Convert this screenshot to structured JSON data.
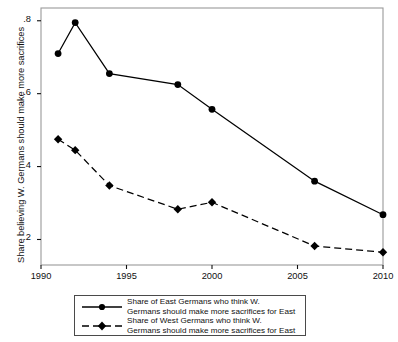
{
  "chart_data": {
    "type": "line",
    "title": "",
    "xlabel": "",
    "ylabel": "Share believing W. Germans should make more sacrifices",
    "xlim": [
      1990,
      2010
    ],
    "ylim": [
      0.13,
      0.835
    ],
    "xticks": [
      1990,
      1995,
      2000,
      2005,
      2010
    ],
    "xtick_labels": [
      "1990",
      "1995",
      "2000",
      "2005",
      "2010"
    ],
    "yticks": [
      0.2,
      0.4,
      0.6,
      0.8
    ],
    "ytick_labels": [
      ".2",
      ".4",
      ".6",
      ".8"
    ],
    "grid": false,
    "legend_position": "below",
    "series": [
      {
        "name": "east",
        "legend_line1": "Share of East Germans who think W.",
        "legend_line2": "Germans should make more sacrifices for East",
        "marker": "circle",
        "linestyle": "solid",
        "color": "#000000",
        "x": [
          1991,
          1992,
          1994,
          1998,
          2000,
          2006,
          2010
        ],
        "values": [
          0.71,
          0.795,
          0.655,
          0.625,
          0.557,
          0.36,
          0.268
        ]
      },
      {
        "name": "west",
        "legend_line1": "Share of West Germans who think W.",
        "legend_line2": "Germans should make more sacrifices for East",
        "marker": "diamond",
        "linestyle": "dashed",
        "color": "#000000",
        "x": [
          1991,
          1992,
          1994,
          1998,
          2000,
          2006,
          2010
        ],
        "values": [
          0.475,
          0.445,
          0.348,
          0.283,
          0.302,
          0.182,
          0.165
        ]
      }
    ]
  }
}
